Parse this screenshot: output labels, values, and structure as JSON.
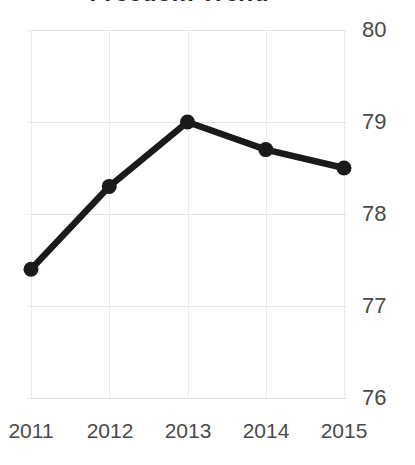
{
  "chart_data": {
    "type": "line",
    "title": "Freedom Trend",
    "xlabel": "",
    "ylabel": "",
    "categories": [
      "2011",
      "2012",
      "2013",
      "2014",
      "2015"
    ],
    "x": [
      2011,
      2012,
      2013,
      2014,
      2015
    ],
    "values": [
      77.4,
      78.3,
      79.0,
      78.7,
      78.5
    ],
    "series": [
      {
        "name": "Freedom Trend",
        "values": [
          77.4,
          78.3,
          79.0,
          78.7,
          78.5
        ]
      }
    ],
    "ylim": [
      76,
      80
    ],
    "xlim": [
      2011,
      2015
    ],
    "ytick_labels": [
      "80",
      "79",
      "78",
      "77",
      "76"
    ],
    "yticks": [
      80,
      79,
      78,
      77,
      76
    ],
    "xtick_labels": [
      "2011",
      "2012",
      "2013",
      "2014",
      "2015"
    ],
    "grid": true,
    "grid_axis": "both",
    "legend": false,
    "legend_position": "none",
    "y_axis_position": "right",
    "line_color": "#1a1a1a",
    "marker": "circle",
    "marker_color": "#1a1a1a",
    "grid_color": "#e4e4e4",
    "tick_label_color": "#4a4a4a",
    "title_color": "#2b2b2b",
    "background_color": "#ffffff"
  }
}
